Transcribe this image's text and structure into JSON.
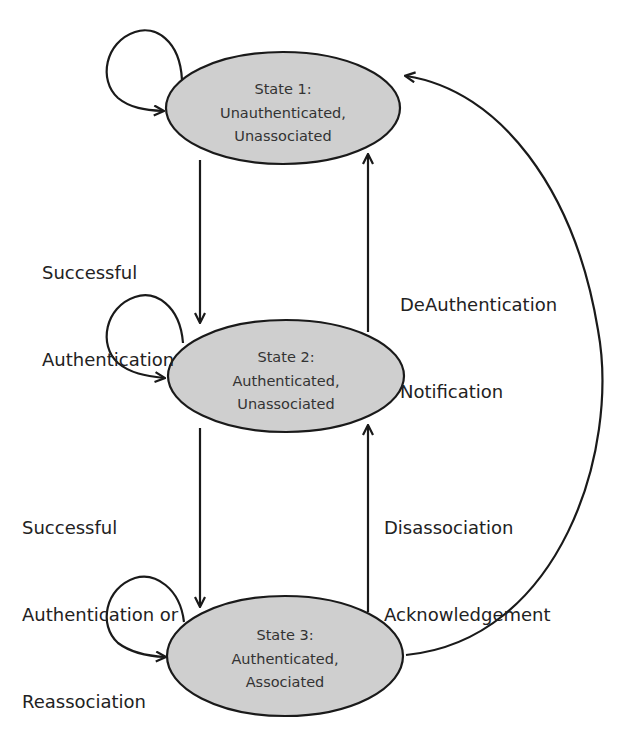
{
  "diagram": {
    "type": "state-machine",
    "states": [
      {
        "id": "state1",
        "title": "State 1:",
        "line1": "Unauthenticated,",
        "line2": "Unassociated"
      },
      {
        "id": "state2",
        "title": "State 2:",
        "line1": "Authenticated,",
        "line2": "Unassociated"
      },
      {
        "id": "state3",
        "title": "State 3:",
        "line1": "Authenticated,",
        "line2": "Associated"
      }
    ],
    "transitions": [
      {
        "from": "state1",
        "to": "state2",
        "label_lines": [
          "Successful",
          "Authentication"
        ]
      },
      {
        "from": "state2",
        "to": "state1",
        "label_lines": [
          "DeAuthentication",
          "Notification"
        ]
      },
      {
        "from": "state2",
        "to": "state3",
        "label_lines": [
          "Successful",
          "Authentication or",
          "Reassociation"
        ]
      },
      {
        "from": "state3",
        "to": "state2",
        "label_lines": [
          "Disassociation",
          "Acknowledgement"
        ]
      },
      {
        "from": "state3",
        "to": "state1",
        "label_lines": []
      },
      {
        "from": "state1",
        "to": "state1",
        "label_lines": []
      },
      {
        "from": "state2",
        "to": "state2",
        "label_lines": []
      },
      {
        "from": "state3",
        "to": "state3",
        "label_lines": []
      }
    ],
    "colors": {
      "state_fill": "#cfcfcf",
      "stroke": "#1a1a1a",
      "text": "#333333"
    }
  }
}
